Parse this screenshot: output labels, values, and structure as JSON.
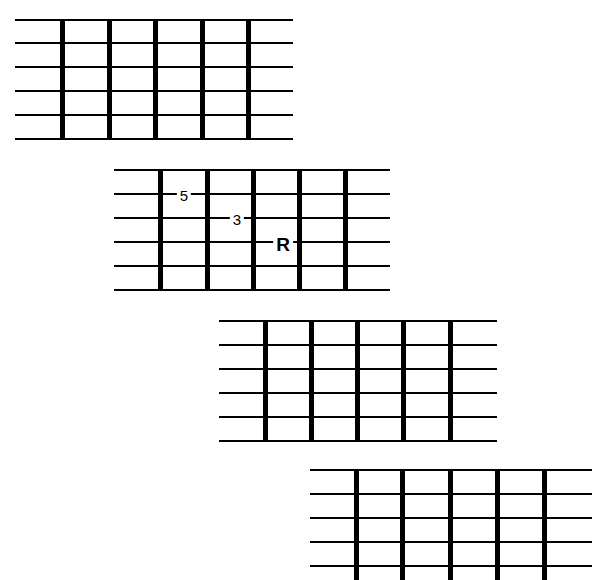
{
  "diagrams": [
    {
      "name": "fretboard-1",
      "strings_y": [
        20,
        43,
        67,
        91,
        115,
        139
      ],
      "string_x": [
        15,
        293
      ],
      "frets_x": [
        62,
        109,
        155,
        202,
        248
      ],
      "fret_y": [
        20,
        140
      ],
      "labels": []
    },
    {
      "name": "fretboard-2",
      "strings_y": [
        170,
        194,
        218,
        242,
        266,
        290
      ],
      "string_x": [
        114,
        390
      ],
      "frets_x": [
        160,
        207,
        253,
        299,
        345
      ],
      "fret_y": [
        170,
        291
      ],
      "labels": [
        {
          "text": "5",
          "x": 184,
          "y": 195,
          "style": "small"
        },
        {
          "text": "3",
          "x": 237,
          "y": 219,
          "style": "small"
        },
        {
          "text": "R",
          "x": 283,
          "y": 244,
          "style": "bold"
        }
      ]
    },
    {
      "name": "fretboard-3",
      "strings_y": [
        321,
        345,
        369,
        393,
        417,
        441
      ],
      "string_x": [
        219,
        497
      ],
      "frets_x": [
        265,
        311,
        357,
        403,
        450
      ],
      "fret_y": [
        321,
        442
      ],
      "labels": []
    },
    {
      "name": "fretboard-4",
      "strings_y": [
        470,
        494,
        518,
        542,
        566
      ],
      "string_x": [
        310,
        592
      ],
      "frets_x": [
        356,
        402,
        450,
        497,
        544
      ],
      "fret_y": [
        470,
        580
      ],
      "labels": []
    }
  ]
}
